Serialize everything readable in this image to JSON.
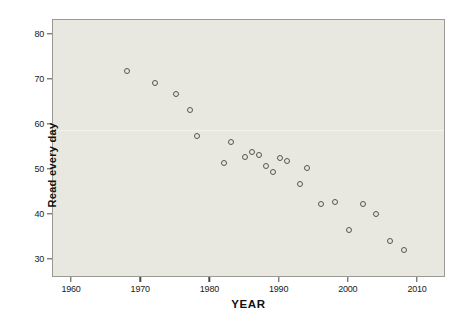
{
  "chart_data": {
    "type": "scatter",
    "title": "",
    "xlabel": "YEAR",
    "ylabel": "Read every day",
    "xlim": [
      1957,
      2012
    ],
    "ylim": [
      28,
      82
    ],
    "xticks": [
      1960,
      1970,
      1980,
      1990,
      2000,
      2010
    ],
    "yticks": [
      30,
      40,
      50,
      60,
      70,
      80
    ],
    "grid": false,
    "legend": null,
    "series": [
      {
        "name": "Read every day",
        "marker": "open-circle",
        "color": "#55554e",
        "points": [
          {
            "x": 1968,
            "y": 72.0
          },
          {
            "x": 1972,
            "y": 69.4
          },
          {
            "x": 1975,
            "y": 66.8
          },
          {
            "x": 1977,
            "y": 63.4
          },
          {
            "x": 1978,
            "y": 57.6
          },
          {
            "x": 1982,
            "y": 51.5
          },
          {
            "x": 1983,
            "y": 56.3
          },
          {
            "x": 1985,
            "y": 53.0
          },
          {
            "x": 1986,
            "y": 54.0
          },
          {
            "x": 1987,
            "y": 53.4
          },
          {
            "x": 1988,
            "y": 51.0
          },
          {
            "x": 1989,
            "y": 49.6
          },
          {
            "x": 1990,
            "y": 52.7
          },
          {
            "x": 1991,
            "y": 51.9
          },
          {
            "x": 1993,
            "y": 46.8
          },
          {
            "x": 1994,
            "y": 50.4
          },
          {
            "x": 1996,
            "y": 42.5
          },
          {
            "x": 1998,
            "y": 43.0
          },
          {
            "x": 2000,
            "y": 36.6
          },
          {
            "x": 2002,
            "y": 42.4
          },
          {
            "x": 2004,
            "y": 40.3
          },
          {
            "x": 2006,
            "y": 34.2
          },
          {
            "x": 2008,
            "y": 32.3
          }
        ]
      }
    ],
    "colors": {
      "plot_background": "#e8e8e0",
      "page_background": "#ffffff",
      "frame": "#9a9a95",
      "marker": "#55554e",
      "text": "#111111"
    }
  }
}
